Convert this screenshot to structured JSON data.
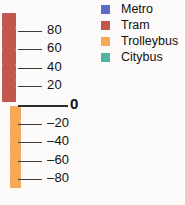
{
  "chart_data": {
    "type": "bar",
    "title": "",
    "subtitle": "",
    "xlabel": "",
    "ylabel": "",
    "orientation": "vertical-diverging",
    "grid": false,
    "legend_position": "top-right",
    "ylim": [
      -95,
      95
    ],
    "tick_labels": [
      "80",
      "60",
      "40",
      "20",
      "0",
      "–20",
      "–40",
      "–60",
      "–80"
    ],
    "tick_values": [
      80,
      60,
      40,
      20,
      0,
      -20,
      -40,
      -60,
      -80
    ],
    "zero_label": "0",
    "series": [
      {
        "name": "Metro",
        "color": "#5b6cc4",
        "values": [
          0
        ]
      },
      {
        "name": "Tram",
        "color": "#c1584f",
        "values": [
          95
        ],
        "marker_count": 12,
        "direction": "positive"
      },
      {
        "name": "Trolleybus",
        "color": "#f5a957",
        "values": [
          -95
        ],
        "marker_count": 11,
        "direction": "negative"
      },
      {
        "name": "Citybus",
        "color": "#4fb3a5",
        "values": [
          0
        ]
      }
    ],
    "positive_markers": [
      {
        "value": 95,
        "color": "#c1584f"
      },
      {
        "value": 87,
        "color": "#c1584f"
      },
      {
        "value": 79,
        "color": "#c1584f"
      },
      {
        "value": 71,
        "color": "#c1584f"
      },
      {
        "value": 63,
        "color": "#c1584f"
      },
      {
        "value": 55,
        "color": "#c1584f"
      },
      {
        "value": 47,
        "color": "#c1584f"
      },
      {
        "value": 39,
        "color": "#c1584f"
      },
      {
        "value": 31,
        "color": "#c1584f"
      },
      {
        "value": 23,
        "color": "#c1584f"
      },
      {
        "value": 15,
        "color": "#c1584f"
      },
      {
        "value": 7,
        "color": "#c1584f"
      }
    ],
    "negative_markers": [
      {
        "value": -5,
        "color": "#f5a957"
      },
      {
        "value": -13,
        "color": "#f5a957"
      },
      {
        "value": -21,
        "color": "#f5a957"
      },
      {
        "value": -29,
        "color": "#f5a957"
      },
      {
        "value": -37,
        "color": "#f5a957"
      },
      {
        "value": -45,
        "color": "#f5a957"
      },
      {
        "value": -53,
        "color": "#f5a957"
      },
      {
        "value": -61,
        "color": "#f5a957"
      },
      {
        "value": -69,
        "color": "#f5a957"
      },
      {
        "value": -77,
        "color": "#f5a957"
      },
      {
        "value": -85,
        "color": "#f5a957"
      }
    ]
  },
  "legend": {
    "items": [
      {
        "label": "Metro",
        "color": "#5b6cc4"
      },
      {
        "label": "Tram",
        "color": "#c1584f"
      },
      {
        "label": "Trolleybus",
        "color": "#f5a957"
      },
      {
        "label": "Citybus",
        "color": "#4fb3a5"
      }
    ]
  }
}
